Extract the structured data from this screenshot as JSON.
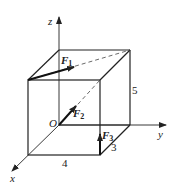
{
  "diagram": {
    "type": "3d-cube-forces",
    "axes": {
      "x": "x",
      "y": "y",
      "z": "z",
      "origin": "O"
    },
    "forces": [
      {
        "name": "F",
        "sub": "1"
      },
      {
        "name": "F",
        "sub": "2"
      },
      {
        "name": "F",
        "sub": "3"
      }
    ],
    "dimensions": {
      "width": "4",
      "depth": "3",
      "height": "5"
    },
    "colors": {
      "line": "#222222",
      "background": "#ffffff"
    }
  }
}
